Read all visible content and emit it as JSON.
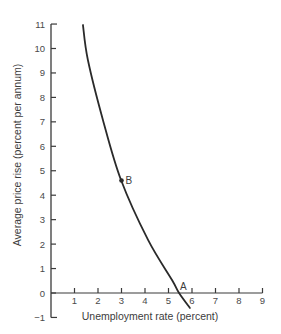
{
  "chart_data": {
    "type": "line",
    "title": "",
    "xlabel": "Unemployment rate (percent)",
    "ylabel": "Average price rise (percent per annum)",
    "xlim": [
      0,
      9
    ],
    "ylim": [
      -1,
      11
    ],
    "x_ticks": [
      1,
      2,
      3,
      4,
      5,
      6,
      7,
      8,
      9
    ],
    "y_ticks": [
      -1,
      0,
      1,
      2,
      3,
      4,
      5,
      6,
      7,
      8,
      9,
      10,
      11
    ],
    "grid": false,
    "legend": null,
    "series": [
      {
        "name": "Phillips curve",
        "x": [
          1.36,
          1.57,
          2.21,
          2.98,
          4.13,
          5.15,
          5.45,
          5.91
        ],
        "y": [
          10.96,
          9.53,
          7.08,
          4.62,
          2.17,
          0.53,
          0.0,
          -0.61
        ]
      }
    ],
    "annotations": [
      {
        "label": "B",
        "x": 3.0,
        "y": 4.6,
        "marker": true
      },
      {
        "label": "A",
        "x": 5.45,
        "y": 0.0,
        "marker": false
      }
    ]
  }
}
